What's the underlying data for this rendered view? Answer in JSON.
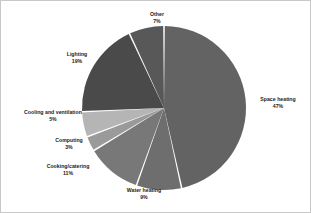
{
  "chart_data": {
    "type": "pie",
    "title": "",
    "subtitle": "",
    "xlabel": "",
    "ylabel": "",
    "legend_position": "none",
    "grid": false,
    "labels_show_percent": true,
    "start_angle_deg": 0,
    "direction": "clockwise",
    "categories": [
      "Space heating",
      "Water heating",
      "Cooking/catering",
      "Computing",
      "Cooling and ventilation",
      "Lighting",
      "Other"
    ],
    "values": [
      47,
      9,
      11,
      3,
      5,
      19,
      7
    ],
    "unit": "%",
    "slices": [
      {
        "label": "Space heating",
        "value": 47,
        "percent_text": "47%",
        "color": "#636363"
      },
      {
        "label": "Water heating",
        "value": 9,
        "percent_text": "9%",
        "color": "#6e6e6e"
      },
      {
        "label": "Cooking/catering",
        "value": 11,
        "percent_text": "11%",
        "color": "#787878"
      },
      {
        "label": "Computing",
        "value": 3,
        "percent_text": "3%",
        "color": "#9a9a9a"
      },
      {
        "label": "Cooling and ventilation",
        "value": 5,
        "percent_text": "5%",
        "color": "#b5b5b5"
      },
      {
        "label": "Lighting",
        "value": 19,
        "percent_text": "19%",
        "color": "#4a4a4a"
      },
      {
        "label": "Other",
        "value": 7,
        "percent_text": "7%",
        "color": "#585858"
      }
    ]
  },
  "style": {
    "background": "#ffffff",
    "border_color": "#c8c8c8",
    "label_color": "#1a1a1a",
    "slice_divider_color": "#ffffff"
  }
}
